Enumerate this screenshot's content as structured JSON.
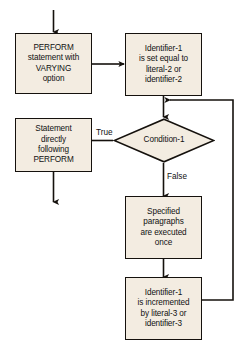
{
  "diagram": {
    "background_color": "#ffffff",
    "node_fill_color": "#f3ece1",
    "line_color": "#15110d",
    "text_color": "#111111"
  },
  "nodes": {
    "perform_statement": {
      "shape": "process",
      "lines": [
        "PERFORM",
        "statement with",
        "VARYING",
        "option"
      ]
    },
    "identifier_init": {
      "shape": "process",
      "lines": [
        "Identifier-1",
        "is set equal to",
        "literal-2 or",
        "identifier-2"
      ]
    },
    "statement_after": {
      "shape": "process",
      "lines": [
        "Statement",
        "directly",
        "following",
        "PERFORM"
      ]
    },
    "condition": {
      "shape": "decision",
      "label": "Condition-1"
    },
    "paragraphs_executed": {
      "shape": "process",
      "lines": [
        "Specified",
        "paragraphs",
        "are executed",
        "once"
      ]
    },
    "identifier_increment": {
      "shape": "process",
      "lines": [
        "Identifier-1",
        "is incremented",
        "by literal-3 or",
        "identifier-3"
      ]
    }
  },
  "edge_labels": {
    "true_branch": "True",
    "false_branch": "False"
  }
}
